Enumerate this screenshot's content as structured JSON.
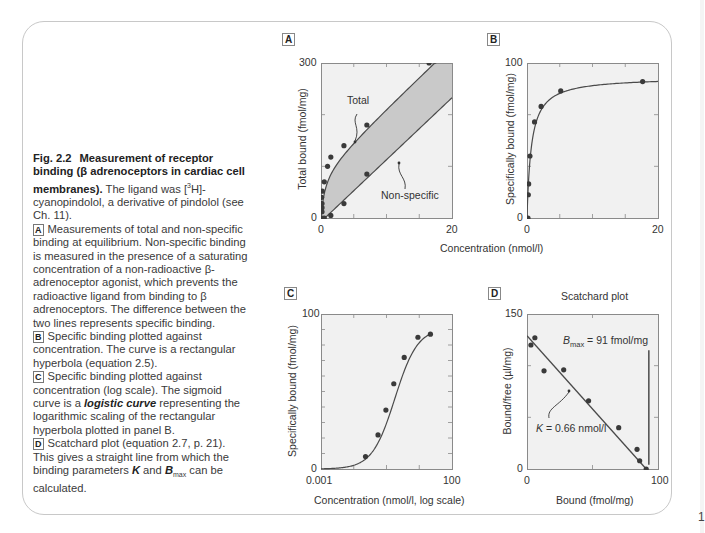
{
  "caption": {
    "fig_number": "Fig. 2.2",
    "title": "Measurement of receptor binding (β adrenoceptors in cardiac cell membranes).",
    "intro": "The ligand was [³H]-cyanopindolol, a derivative of pindolol (see Ch. 11).",
    "intro_pre": "The ligand was [",
    "intro_sup": "3",
    "intro_post": "H]-cyanopindolol, a derivative of pindolol (see Ch. 11).",
    "panels": [
      {
        "tag": "A",
        "text": "Measurements of total and non-specific binding at equilibrium. Non-specific binding is measured in the presence of a saturating concentration of a non-radioactive β-adrenoceptor agonist, which prevents the radioactive ligand from binding to β  adrenoceptors. The difference between the two lines represents specific binding."
      },
      {
        "tag": "B",
        "text": "Specific binding plotted against concentration. The curve is a rectangular hyperbola (equation 2.5)."
      },
      {
        "tag": "C",
        "text_pre": "Specific binding plotted against concentration (log scale). The sigmoid curve is a ",
        "text_em": "logistic curve",
        "text_post": " representing the logarithmic scaling of the rectangular hyperbola plotted in panel B."
      },
      {
        "tag": "D",
        "text_pre": "Scatchard plot (equation 2.7, p. 21). This gives a straight line from which the binding parameters ",
        "K": "K",
        "text_mid": " and ",
        "B": "B",
        "B_sub": "max",
        "text_post": " can be calculated."
      }
    ]
  },
  "edge_char": "1",
  "colors": {
    "plot_bg": "#f1f1f1",
    "frame_line": "#8a8a8a",
    "curve": "#4a4a4a",
    "point": "#3a3a3a",
    "shaded": "#c9c9c9"
  },
  "chart_data": [
    {
      "panel": "A",
      "type": "scatter",
      "title": "",
      "xlabel": "",
      "ylabel": "Total bound (fmol/mg)",
      "xlim": [
        0,
        20
      ],
      "ylim": [
        0,
        300
      ],
      "xticks": [
        "0",
        "20"
      ],
      "yticks": [
        "0",
        "300"
      ],
      "series": [
        {
          "name": "Total",
          "x": [
            0,
            0,
            0,
            0,
            0.1,
            0.2,
            0.5,
            1.0,
            1.5,
            3.5,
            7.0,
            16.5
          ],
          "y": [
            0,
            12,
            20,
            28,
            40,
            52,
            70,
            100,
            118,
            140,
            180,
            300
          ]
        },
        {
          "name": "Non-specific",
          "x": [
            0.5,
            1.5,
            3.5,
            7.0
          ],
          "y": [
            0,
            5,
            28,
            85
          ]
        }
      ],
      "annotations": [
        "Total",
        "Non-specific"
      ],
      "shaded_region": "between Total and Non-specific (specific binding)"
    },
    {
      "panel": "B",
      "type": "line",
      "title": "",
      "xlabel": "Concentration (nmol/l)",
      "ylabel": "Specifically bound (fmol/mg)",
      "xlim": [
        0,
        20
      ],
      "ylim": [
        0,
        100
      ],
      "xticks": [
        "0",
        "20"
      ],
      "yticks": [
        "0",
        "100"
      ],
      "x": [
        0,
        0.05,
        0.1,
        0.3,
        1.0,
        2.0,
        5.0,
        17.5
      ],
      "values": [
        0,
        15,
        22,
        40,
        62,
        72,
        82,
        88
      ],
      "fit": "rectangular hyperbola"
    },
    {
      "panel": "C",
      "type": "line",
      "title": "",
      "xlabel": "Concentration (nmol/l, log scale)",
      "ylabel": "Specifically bound (fmol/mg)",
      "xscale": "log",
      "xlim": [
        0.001,
        100
      ],
      "ylim": [
        0,
        100
      ],
      "xticks": [
        "0.001",
        "100"
      ],
      "yticks": [
        "0",
        "100"
      ],
      "x": [
        0.05,
        0.15,
        0.3,
        0.6,
        1.5,
        5,
        15
      ],
      "values": [
        8,
        22,
        38,
        55,
        72,
        85,
        87
      ],
      "fit": "logistic curve"
    },
    {
      "panel": "D",
      "type": "scatter",
      "title": "Scatchard plot",
      "xlabel": "Bound (fmol/mg)",
      "ylabel": "Bound/free (µl/mg)",
      "xlim": [
        0,
        100
      ],
      "ylim": [
        0,
        150
      ],
      "xticks": [
        "0",
        "100"
      ],
      "yticks": [
        "0",
        "150"
      ],
      "x": [
        3,
        6,
        13,
        28,
        47,
        70,
        84,
        86,
        91
      ],
      "values": [
        120,
        127,
        95,
        96,
        66,
        40,
        19,
        8,
        0
      ],
      "fit_line": {
        "x": [
          0,
          91
        ],
        "y": [
          129,
          0
        ]
      },
      "annotations": {
        "bmax": "B_max = 91 fmol/mg",
        "k": "K = 0.66 nmol/l"
      },
      "bmax_line_x": 93,
      "bmax_line_y": [
        4,
        115
      ]
    }
  ],
  "panels": {
    "A": {
      "tag": "A",
      "ylabel": "Total bound (fmol/mg)",
      "ymin": "0",
      "ymax": "300",
      "xmin": "0",
      "xmax": "20",
      "total_label": "Total",
      "nonspec_label": "Non-specific"
    },
    "B": {
      "tag": "B",
      "ylabel": "Specifically bound (fmol/mg)",
      "ymin": "0",
      "ymax": "100",
      "xmin": "0",
      "xmax": "20"
    },
    "AB_xlabel": "Concentration (nmol/l)",
    "C": {
      "tag": "C",
      "ylabel": "Specifically bound (fmol/mg)",
      "ymin": "0",
      "ymax": "100",
      "xmin": "0.001",
      "xmax": "100",
      "xlabel": "Concentration (nmol/l, log scale)"
    },
    "D": {
      "tag": "D",
      "title": "Scatchard plot",
      "ylabel": "Bound/free (µl/mg)",
      "ymin": "0",
      "ymax": "150",
      "xmin": "0",
      "xmax": "100",
      "xlabel": "Bound (fmol/mg)",
      "bmax_B": "B",
      "bmax_sub": "max",
      "bmax_rest": " = 91 fmol/mg",
      "k_K": "K",
      "k_rest": " = 0.66 nmol/l"
    }
  }
}
